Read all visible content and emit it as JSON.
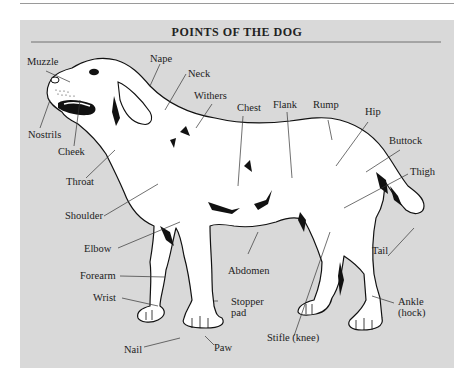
{
  "diagram": {
    "title": "POINTS OF THE DOG",
    "colors": {
      "panel_background": "#d9d9d9",
      "dog_fill": "#ffffff",
      "outline": "#111111",
      "leader_lines": "#333333",
      "text": "#222222"
    },
    "labels": {
      "muzzle": "Muzzle",
      "nape": "Nape",
      "neck": "Neck",
      "withers": "Withers",
      "chest": "Chest",
      "flank": "Flank",
      "rump": "Rump",
      "hip": "Hip",
      "buttock": "Buttock",
      "thigh": "Thigh",
      "nostrils": "Nostrils",
      "cheek": "Cheek",
      "throat": "Throat",
      "shoulder": "Shoulder",
      "elbow": "Elbow",
      "forearm": "Forearm",
      "wrist": "Wrist",
      "abdomen": "Abdomen",
      "stopper_pad_line1": "Stopper",
      "stopper_pad_line2": "pad",
      "tail": "Tail",
      "ankle_line1": "Ankle",
      "ankle_line2": "(hock)",
      "stifle": "Stifle (knee)",
      "nail": "Nail",
      "paw": "Paw"
    }
  }
}
